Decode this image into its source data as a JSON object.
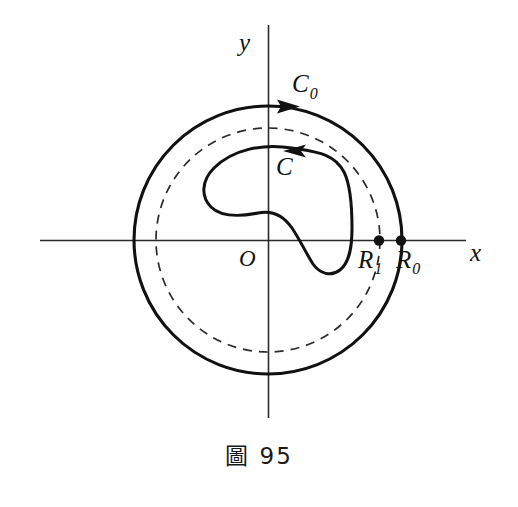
{
  "figure": {
    "caption": "圖 95",
    "caption_figure_word": "圖",
    "caption_number": "95",
    "background_color": "#ffffff",
    "ink_color": "#111111"
  },
  "axes": {
    "x_label": "x",
    "y_label": "y",
    "origin_label": "O",
    "x_axis_from": [
      40,
      240
    ],
    "x_axis_to": [
      466,
      240
    ],
    "y_axis_from": [
      268,
      25
    ],
    "y_axis_to": [
      268,
      418
    ]
  },
  "curves": {
    "outer": {
      "label": "C",
      "label_subscript": "0",
      "label_full": "C0",
      "type": "circle-solid",
      "center": [
        268,
        240
      ],
      "radius": 134,
      "orientation": "clockwise",
      "arrow_at": "top",
      "arrow_direction": "right"
    },
    "dashed": {
      "label": "",
      "type": "circle-dashed",
      "center": [
        268,
        240
      ],
      "radius": 112,
      "dash_pattern": "9 7"
    },
    "inner": {
      "label": "C",
      "type": "closed-contour",
      "orientation": "counterclockwise",
      "arrow_at": "top",
      "arrow_direction": "left"
    }
  },
  "points": [
    {
      "name": "R1",
      "label": "R",
      "subscript": "1",
      "x": 379,
      "y": 240,
      "on": "dashed-circle"
    },
    {
      "name": "R0",
      "label": "R",
      "subscript": "0",
      "x": 401,
      "y": 240,
      "on": "outer-circle"
    }
  ]
}
